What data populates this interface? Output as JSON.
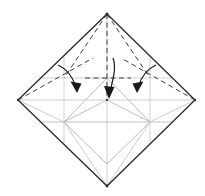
{
  "figure": {
    "canvas": {
      "width": 205,
      "height": 196,
      "background": "#ffffff"
    }
  },
  "colors": {
    "outline": "#2a2a2a",
    "crease_light": "#b9b9b9",
    "crease_mid": "#9a9a9a",
    "fold_dashed": "#3a3a3a",
    "arrow": "#1a1a1a",
    "background": "#ffffff"
  },
  "geometry": {
    "vertices": {
      "top": {
        "label": "top-vertex",
        "x": 107,
        "y": 14
      },
      "right": {
        "label": "right-vertex",
        "x": 195,
        "y": 100
      },
      "bottom": {
        "label": "bottom-vertex",
        "x": 107,
        "y": 186
      },
      "left": {
        "label": "left-vertex",
        "x": 18,
        "y": 100
      }
    },
    "center": {
      "label": "center-point",
      "x": 107,
      "y": 100
    },
    "inner_square": {
      "top": {
        "x": 107,
        "y": 78
      },
      "right": {
        "x": 150,
        "y": 122
      },
      "bottom": {
        "x": 107,
        "y": 164
      },
      "left": {
        "x": 64,
        "y": 122
      }
    },
    "mid_edge_points": {
      "upper_left": {
        "x": 64,
        "y": 78
      },
      "upper_right": {
        "x": 150,
        "y": 78
      },
      "lower_left": {
        "x": 64,
        "y": 122
      },
      "lower_right": {
        "x": 150,
        "y": 122
      }
    }
  },
  "outline": {
    "name": "paper-outline",
    "points": "107,14 195,100 107,186 18,100",
    "stroke_width": 1.3
  },
  "creases": [
    {
      "name": "crease-diagonal-vertical",
      "x1": 107,
      "y1": 14,
      "x2": 107,
      "y2": 186,
      "weight": "light"
    },
    {
      "name": "crease-diagonal-horizontal",
      "x1": 18,
      "y1": 100,
      "x2": 195,
      "y2": 100,
      "weight": "light"
    },
    {
      "name": "crease-horizontal-upper",
      "x1": 42,
      "y1": 78,
      "x2": 172,
      "y2": 78,
      "weight": "light"
    },
    {
      "name": "crease-horizontal-lower",
      "x1": 42,
      "y1": 122,
      "x2": 172,
      "y2": 122,
      "weight": "light"
    },
    {
      "name": "crease-vertical-left",
      "x1": 64,
      "y1": 56,
      "x2": 64,
      "y2": 144,
      "weight": "light"
    },
    {
      "name": "crease-vertical-right",
      "x1": 150,
      "y1": 56,
      "x2": 150,
      "y2": 144,
      "weight": "light"
    },
    {
      "name": "crease-inner-square-tl",
      "x1": 64,
      "y1": 122,
      "x2": 107,
      "y2": 78,
      "weight": "mid"
    },
    {
      "name": "crease-inner-square-tr",
      "x1": 107,
      "y1": 78,
      "x2": 150,
      "y2": 122,
      "weight": "mid"
    },
    {
      "name": "crease-inner-square-bl",
      "x1": 64,
      "y1": 122,
      "x2": 107,
      "y2": 164,
      "weight": "mid"
    },
    {
      "name": "crease-inner-square-br",
      "x1": 150,
      "y1": 122,
      "x2": 107,
      "y2": 164,
      "weight": "mid"
    },
    {
      "name": "crease-center-to-lower-left",
      "x1": 107,
      "y1": 100,
      "x2": 64,
      "y2": 122,
      "weight": "mid"
    },
    {
      "name": "crease-center-to-lower-right",
      "x1": 107,
      "y1": 100,
      "x2": 150,
      "y2": 122,
      "weight": "mid"
    },
    {
      "name": "crease-left-vertex-to-inner",
      "x1": 18,
      "y1": 100,
      "x2": 64,
      "y2": 122,
      "weight": "light"
    },
    {
      "name": "crease-right-vertex-to-inner",
      "x1": 195,
      "y1": 100,
      "x2": 150,
      "y2": 122,
      "weight": "light"
    },
    {
      "name": "crease-bottom-vertex-to-left",
      "x1": 107,
      "y1": 186,
      "x2": 64,
      "y2": 122,
      "weight": "light"
    },
    {
      "name": "crease-bottom-vertex-to-right",
      "x1": 107,
      "y1": 186,
      "x2": 150,
      "y2": 122,
      "weight": "light"
    }
  ],
  "fold_lines": [
    {
      "name": "fold-line-top-to-left-mid",
      "x1": 107,
      "y1": 14,
      "x2": 64,
      "y2": 78,
      "style": "dashed"
    },
    {
      "name": "fold-line-top-to-right-mid",
      "x1": 107,
      "y1": 14,
      "x2": 150,
      "y2": 78,
      "style": "dashed"
    },
    {
      "name": "fold-line-top-to-center",
      "x1": 107,
      "y1": 14,
      "x2": 107,
      "y2": 100,
      "style": "dashed"
    },
    {
      "name": "fold-line-left-vertex-up",
      "x1": 18,
      "y1": 100,
      "x2": 93,
      "y2": 58,
      "style": "dashed"
    },
    {
      "name": "fold-line-right-vertex-up",
      "x1": 195,
      "y1": 100,
      "x2": 121,
      "y2": 58,
      "style": "dashed"
    },
    {
      "name": "fold-line-horizontal-center",
      "x1": 85,
      "y1": 78,
      "x2": 131,
      "y2": 78,
      "style": "dashed"
    }
  ],
  "arrows": [
    {
      "name": "fold-arrow-left",
      "path": "M 58 66 C 66 70, 72 78, 76 88",
      "head": "M 76 92 L 71 82 L 81 83 Z",
      "direction": "down-right"
    },
    {
      "name": "fold-arrow-center",
      "path": "M 113 60 C 116 70, 112 82, 110 93",
      "head": "M 109 98 L 104 87 L 114 88 Z",
      "direction": "down"
    },
    {
      "name": "fold-arrow-right",
      "path": "M 156 66 C 148 70, 142 78, 138 88",
      "head": "M 138 92 L 133 83, L 143 82 Z",
      "direction": "down-left"
    }
  ]
}
